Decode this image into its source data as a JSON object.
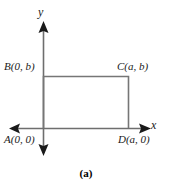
{
  "figure": {
    "caption": "(a)",
    "axes": {
      "x_axis_label": "x",
      "y_axis_label": "y"
    },
    "points": [
      {
        "id": "B",
        "label": "B(0, b)",
        "x": 0,
        "y": 0.0
      },
      {
        "id": "C",
        "label": "C(a, b)",
        "x": 0,
        "y": 0.0
      },
      {
        "id": "A",
        "label": "A(0, 0)",
        "x": 0,
        "y": 0.0
      },
      {
        "id": "D",
        "label": "D(a, 0)",
        "x": 0,
        "y": 0.0
      }
    ],
    "labels": {
      "A": "A(0, 0)",
      "B": "B(0, b)",
      "C": "C(a, b)",
      "D": "D(a, 0)"
    },
    "colors": {
      "rectangle_stroke": "#767676",
      "axis_stroke": "#6e6e6e",
      "arrowhead_fill": "#1a1a1a",
      "text": "#1a1a1a",
      "background": "#ffffff"
    }
  }
}
